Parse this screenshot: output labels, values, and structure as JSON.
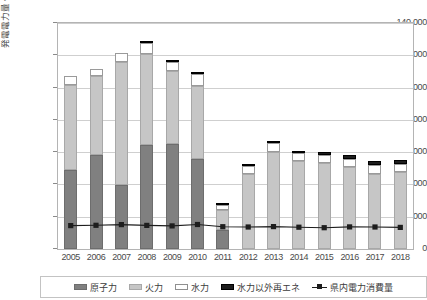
{
  "chart_title": "",
  "axis": {
    "y_title": "発電電力量・電力消費量[百万kWh]",
    "y_ticks": [
      "0",
      "20,000",
      "40,000",
      "60,000",
      "80,000",
      "100,000",
      "120,000",
      "140,000"
    ]
  },
  "legend": {
    "items": [
      {
        "label": "原子力",
        "icon": "legend-swatch-nuclear",
        "color": "#808080"
      },
      {
        "label": "火力",
        "icon": "legend-swatch-thermal",
        "color": "#c6c6c6"
      },
      {
        "label": "水力",
        "icon": "legend-swatch-hydro",
        "color": "#ffffff"
      },
      {
        "label": "水力以外再エネ",
        "icon": "legend-swatch-renewable",
        "color": "#1d1d1d"
      },
      {
        "label": "県内電力消費量",
        "icon": "legend-line-marker",
        "color": "#1d1d1d"
      }
    ]
  },
  "chart_data": {
    "type": "bar",
    "title": "",
    "xlabel": "",
    "ylabel": "発電電力量・電力消費量[百万kWh]",
    "ylim": [
      0,
      140000
    ],
    "ytick_step": 20000,
    "grid": true,
    "legend_position": "bottom",
    "categories": [
      "2005",
      "2006",
      "2007",
      "2008",
      "2009",
      "2010",
      "2011",
      "2012",
      "2013",
      "2014",
      "2015",
      "2016",
      "2017",
      "2018"
    ],
    "stacked": true,
    "series": [
      {
        "name": "原子力",
        "type": "bar",
        "color": "#808080",
        "values": [
          49000,
          58500,
          39500,
          64500,
          65000,
          55500,
          11500,
          0,
          0,
          0,
          0,
          0,
          0,
          0
        ]
      },
      {
        "name": "火力",
        "type": "bar",
        "color": "#c6c6c6",
        "values": [
          52500,
          48500,
          76500,
          56500,
          45500,
          45500,
          12500,
          46500,
          60000,
          54500,
          53500,
          50500,
          46500,
          47500
        ]
      },
      {
        "name": "水力",
        "type": "bar",
        "color": "#ffffff",
        "values": [
          5500,
          4500,
          5500,
          6500,
          5500,
          7500,
          3500,
          5000,
          5500,
          5000,
          4500,
          5000,
          5500,
          5000
        ]
      },
      {
        "name": "水力以外再エネ",
        "type": "bar",
        "color": "#1d1d1d",
        "values": [
          0,
          0,
          0,
          800,
          800,
          800,
          800,
          1000,
          1500,
          1500,
          2000,
          2500,
          2500,
          2500
        ]
      },
      {
        "name": "県内電力消費量",
        "type": "line",
        "color": "#1d1d1d",
        "marker": "square",
        "values": [
          14500,
          14700,
          15100,
          14600,
          14300,
          15200,
          13800,
          13600,
          13900,
          13500,
          13200,
          13700,
          13600,
          13400
        ]
      }
    ]
  }
}
